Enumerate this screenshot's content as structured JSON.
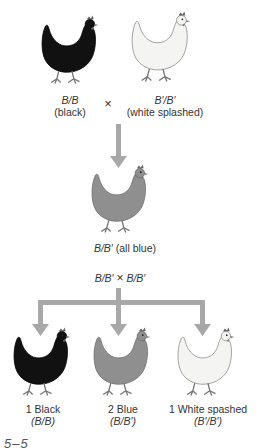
{
  "parents": {
    "left": {
      "genotype": "B/B",
      "phenotype": "(black)",
      "color": "#111111"
    },
    "cross_symbol": "×",
    "right": {
      "genotype": "B′/B′",
      "phenotype": "(white splashed)",
      "color": "#f4f4f2"
    }
  },
  "f1": {
    "label_genotype": "B/B′",
    "label_phenotype": "(all blue)",
    "color": "#8f8f8f"
  },
  "f1_cross": {
    "left": "B/B′",
    "symbol": "×",
    "right": "B/B′"
  },
  "offspring": [
    {
      "count_label": "1 Black",
      "genotype": "(B/B)",
      "color": "#111111"
    },
    {
      "count_label": "2 Blue",
      "genotype": "(B/B′)",
      "color": "#8f8f8f"
    },
    {
      "count_label": "1 White spashed",
      "genotype": "(B′/B′)",
      "color": "#f4f4f2"
    }
  ],
  "arrow_color": "#a8a8a8",
  "figure_label": "5–5"
}
